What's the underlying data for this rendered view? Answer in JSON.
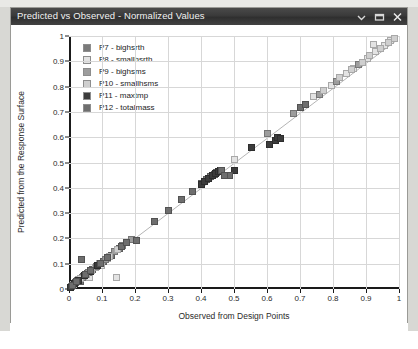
{
  "window": {
    "title": "Predicted vs Observed - Normalized Values",
    "controls": [
      {
        "name": "chevron-down-icon",
        "label": "▾"
      },
      {
        "name": "restore-window-icon",
        "label": "❐"
      },
      {
        "name": "close-icon",
        "label": "✕"
      }
    ]
  },
  "chart_data": {
    "type": "scatter",
    "title": "Predicted vs Observed - Normalized Values",
    "xlabel": "Observed from Design Points",
    "ylabel": "Predicted from the Response Surface",
    "xlim": [
      0,
      1
    ],
    "ylim": [
      0,
      1
    ],
    "xticks": [
      "0",
      "0.1",
      "0.2",
      "0.3",
      "0.4",
      "0.5",
      "0.6",
      "0.7",
      "0.8",
      "0.9",
      "1"
    ],
    "yticks": [
      "0",
      "0.1",
      "0.2",
      "0.3",
      "0.4",
      "0.5",
      "0.6",
      "0.7",
      "0.8",
      "0.9",
      "1"
    ],
    "grid": true,
    "legend_position": "top-left",
    "reference_line": {
      "type": "identity",
      "from": [
        0.0,
        0.0
      ],
      "to": [
        1.0,
        1.0
      ],
      "color": "#b0b0b0"
    },
    "series": [
      {
        "name": "P7 - bighsrth",
        "color": "#7a7a7a",
        "points": [
          [
            0.012,
            0.015
          ],
          [
            0.021,
            0.026
          ],
          [
            0.034,
            0.03
          ],
          [
            0.043,
            0.049
          ],
          [
            0.055,
            0.06
          ],
          [
            0.072,
            0.078
          ],
          [
            0.088,
            0.093
          ],
          [
            0.104,
            0.11
          ],
          [
            0.128,
            0.133
          ],
          [
            0.152,
            0.16
          ],
          [
            0.402,
            0.418
          ],
          [
            0.418,
            0.432
          ],
          [
            0.43,
            0.445
          ],
          [
            0.441,
            0.452
          ],
          [
            0.448,
            0.461
          ]
        ]
      },
      {
        "name": "P8 - smallhsrth",
        "color": "#e3e3e3",
        "points": [
          [
            0.018,
            0.02
          ],
          [
            0.03,
            0.036
          ],
          [
            0.047,
            0.052
          ],
          [
            0.061,
            0.044
          ],
          [
            0.079,
            0.085
          ],
          [
            0.098,
            0.092
          ],
          [
            0.116,
            0.12
          ],
          [
            0.145,
            0.045
          ],
          [
            0.5,
            0.512
          ],
          [
            0.742,
            0.76
          ],
          [
            0.795,
            0.806
          ],
          [
            0.842,
            0.852
          ],
          [
            0.863,
            0.87
          ],
          [
            0.905,
            0.912
          ],
          [
            0.93,
            0.938
          ],
          [
            0.955,
            0.962
          ],
          [
            0.975,
            0.982
          ],
          [
            0.922,
            0.968
          ]
        ]
      },
      {
        "name": "P9 - bighsms",
        "color": "#9d9d9d",
        "points": [
          [
            0.008,
            0.01
          ],
          [
            0.026,
            0.032
          ],
          [
            0.04,
            0.046
          ],
          [
            0.058,
            0.066
          ],
          [
            0.082,
            0.088
          ],
          [
            0.11,
            0.118
          ],
          [
            0.138,
            0.148
          ],
          [
            0.162,
            0.17
          ],
          [
            0.188,
            0.196
          ],
          [
            0.6,
            0.614
          ],
          [
            0.68,
            0.694
          ],
          [
            0.758,
            0.77
          ],
          [
            0.81,
            0.822
          ],
          [
            0.878,
            0.888
          ]
        ]
      },
      {
        "name": "P10 - smallhsms",
        "color": "#cfcfcf",
        "points": [
          [
            0.014,
            0.018
          ],
          [
            0.036,
            0.042
          ],
          [
            0.052,
            0.058
          ],
          [
            0.068,
            0.074
          ],
          [
            0.092,
            0.1
          ],
          [
            0.122,
            0.13
          ],
          [
            0.148,
            0.156
          ],
          [
            0.77,
            0.784
          ],
          [
            0.82,
            0.834
          ],
          [
            0.855,
            0.866
          ],
          [
            0.888,
            0.896
          ],
          [
            0.912,
            0.922
          ],
          [
            0.945,
            0.952
          ],
          [
            0.968,
            0.975
          ],
          [
            0.985,
            0.992
          ]
        ]
      },
      {
        "name": "P11 - maxtmp",
        "color": "#3c3c3c",
        "points": [
          [
            0.004,
            0.006
          ],
          [
            0.016,
            0.022
          ],
          [
            0.028,
            0.034
          ],
          [
            0.046,
            0.052
          ],
          [
            0.064,
            0.07
          ],
          [
            0.086,
            0.094
          ],
          [
            0.4,
            0.412
          ],
          [
            0.412,
            0.426
          ],
          [
            0.424,
            0.438
          ],
          [
            0.436,
            0.448
          ],
          [
            0.444,
            0.456
          ],
          [
            0.452,
            0.465
          ],
          [
            0.458,
            0.47
          ],
          [
            0.608,
            0.57
          ],
          [
            0.625,
            0.588
          ],
          [
            0.632,
            0.6
          ],
          [
            0.64,
            0.596
          ],
          [
            0.552,
            0.56
          ],
          [
            0.5,
            0.47
          ]
        ]
      },
      {
        "name": "P12 - totalmass",
        "color": "#6e6e6e",
        "points": [
          [
            0.01,
            0.012
          ],
          [
            0.024,
            0.028
          ],
          [
            0.038,
            0.118
          ],
          [
            0.05,
            0.056
          ],
          [
            0.066,
            0.072
          ],
          [
            0.096,
            0.102
          ],
          [
            0.118,
            0.126
          ],
          [
            0.16,
            0.168
          ],
          [
            0.175,
            0.182
          ],
          [
            0.205,
            0.19
          ],
          [
            0.26,
            0.268
          ],
          [
            0.3,
            0.31
          ],
          [
            0.34,
            0.352
          ],
          [
            0.375,
            0.386
          ],
          [
            0.486,
            0.448
          ],
          [
            0.462,
            0.47
          ],
          [
            0.47,
            0.45
          ],
          [
            0.7,
            0.716
          ],
          [
            0.718,
            0.73
          ]
        ]
      }
    ]
  }
}
